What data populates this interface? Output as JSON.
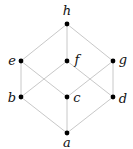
{
  "diagram": {
    "type": "hasse-diagram",
    "nodes": [
      {
        "id": "h",
        "label": "h",
        "x": 67,
        "y": 24,
        "lx": 67,
        "ly": 15,
        "anchor": "middle"
      },
      {
        "id": "e",
        "label": "e",
        "x": 21,
        "y": 61,
        "lx": 12,
        "ly": 65,
        "anchor": "middle"
      },
      {
        "id": "f",
        "label": "f",
        "x": 67,
        "y": 61,
        "lx": 77,
        "ly": 64,
        "anchor": "middle"
      },
      {
        "id": "g",
        "label": "g",
        "x": 113,
        "y": 61,
        "lx": 123,
        "ly": 64,
        "anchor": "middle"
      },
      {
        "id": "b",
        "label": "b",
        "x": 21,
        "y": 97,
        "lx": 12,
        "ly": 102,
        "anchor": "middle"
      },
      {
        "id": "c",
        "label": "c",
        "x": 67,
        "y": 97,
        "lx": 77,
        "ly": 102,
        "anchor": "middle"
      },
      {
        "id": "d",
        "label": "d",
        "x": 113,
        "y": 97,
        "lx": 123,
        "ly": 103,
        "anchor": "middle"
      },
      {
        "id": "a",
        "label": "a",
        "x": 67,
        "y": 133,
        "lx": 67,
        "ly": 147,
        "anchor": "middle"
      }
    ],
    "edges": [
      [
        "a",
        "b"
      ],
      [
        "a",
        "c"
      ],
      [
        "a",
        "d"
      ],
      [
        "b",
        "e"
      ],
      [
        "b",
        "f"
      ],
      [
        "c",
        "e"
      ],
      [
        "c",
        "g"
      ],
      [
        "d",
        "f"
      ],
      [
        "d",
        "g"
      ],
      [
        "e",
        "h"
      ],
      [
        "f",
        "h"
      ],
      [
        "g",
        "h"
      ]
    ],
    "colors": {
      "edge": "#c8c8c8",
      "node": "#000000",
      "label": "#111111"
    }
  }
}
